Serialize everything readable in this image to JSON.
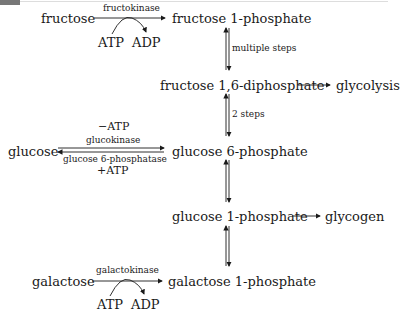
{
  "diagram": {
    "nodes": {
      "fructose": "fructose",
      "fructose_1p": "fructose 1-phosphate",
      "fructose_16dp": "fructose 1,6-diphosphate",
      "glycolysis": "glycolysis",
      "glucose": "glucose",
      "glucose_6p": "glucose 6-phosphate",
      "glucose_1p": "glucose 1-phosphate",
      "glycogen": "glycogen",
      "galactose": "galactose",
      "galactose_1p": "galactose 1-phosphate"
    },
    "edges": {
      "fructokinase": "fructokinase",
      "fructo_atp": "ATP",
      "fructo_adp": "ADP",
      "multiple_steps": "multiple steps",
      "two_steps": "2 steps",
      "minus_atp": "−ATP",
      "glucokinase": "glucokinase",
      "g6pase": "glucose 6-phosphatase",
      "plus_atp": "+ATP",
      "galactokinase": "galactokinase",
      "galacto_atp": "ATP",
      "galacto_adp": "ADP"
    }
  }
}
